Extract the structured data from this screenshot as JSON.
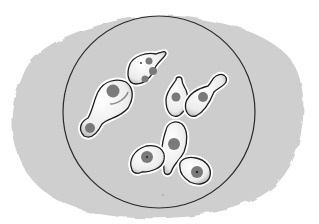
{
  "illustration": {
    "subject": "budding yeast cells in microscope field",
    "colors": {
      "page_background": "#ffffff",
      "blob_background": "#cfcfcf",
      "field_fill": "#cdcdcd",
      "field_outline": "#2a2a2a",
      "cell_fill": "#f4f4f4",
      "cell_outline": "#1e1e1e",
      "nucleus": "#7a7a7a",
      "nucleus_dot": "#222222",
      "halo": "#ffffff"
    },
    "field_circle": {
      "cx": 159,
      "cy": 112,
      "r": 96
    },
    "cell_count": 8
  }
}
